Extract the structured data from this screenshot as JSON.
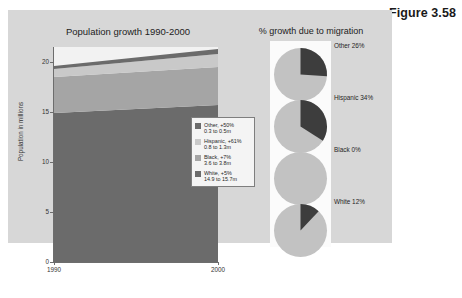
{
  "figure": {
    "caption": "Figure 3.58"
  },
  "area_chart": {
    "title": "Population growth 1990-2000",
    "ylabel": "Population in millions",
    "yticks": [
      "20",
      "15",
      "10",
      "5",
      "0"
    ],
    "xticks": [
      "1990",
      "2000"
    ]
  },
  "legend": {
    "items": [
      {
        "name": "other",
        "label": "Other, +50%",
        "detail": "0.3 to 0.5m",
        "color": "#6b6b6b"
      },
      {
        "name": "hispanic",
        "label": "Hispanic, +61%",
        "detail": "0.8 to 1.3m",
        "color": "#c9c9c9"
      },
      {
        "name": "black",
        "label": "Black, +7%",
        "detail": "3.6 to 3.8m",
        "color": "#a5a5a5"
      },
      {
        "name": "white",
        "label": "White, +5%",
        "detail": "14.9 to 15.7m",
        "color": "#6b6b6b"
      }
    ]
  },
  "pie_section": {
    "title": "% growth due to migration",
    "pies": [
      {
        "name": "other",
        "label": "Other  26%",
        "percent": 26
      },
      {
        "name": "hispanic",
        "label": "Hispanic  34%",
        "percent": 34
      },
      {
        "name": "black",
        "label": "Black  0%",
        "percent": 0
      },
      {
        "name": "white",
        "label": "White  12%",
        "percent": 12
      }
    ]
  },
  "colors": {
    "panel_bg": "#d7d7d7",
    "plot_bg": "#f2f2f2",
    "pie_light": "#c2c2c2",
    "pie_dark": "#3d3d3d",
    "axis": "#6d6d6d"
  },
  "chart_data": {
    "type": "area",
    "title": "Population growth 1990-2000",
    "xlabel": "",
    "ylabel": "Population in millions",
    "x": [
      1990,
      2000
    ],
    "xlim": [
      1990,
      2000
    ],
    "ylim": [
      0,
      21.5
    ],
    "yticks": [
      0,
      5,
      10,
      15,
      20
    ],
    "stacked": true,
    "grid": false,
    "legend_position": "inside-right",
    "series": [
      {
        "name": "White",
        "values": [
          14.9,
          15.7
        ],
        "growth_pct": 5,
        "color": "#6b6b6b"
      },
      {
        "name": "Black",
        "values": [
          3.6,
          3.8
        ],
        "growth_pct": 7,
        "color": "#a5a5a5"
      },
      {
        "name": "Hispanic",
        "values": [
          0.8,
          1.3
        ],
        "growth_pct": 61,
        "color": "#c9c9c9"
      },
      {
        "name": "Other",
        "values": [
          0.3,
          0.5
        ],
        "growth_pct": 50,
        "color": "#6b6b6b"
      }
    ],
    "totals": [
      19.6,
      21.3
    ]
  },
  "chart_data_pies": {
    "type": "pie",
    "title": "% growth due to migration",
    "charts": [
      {
        "name": "Other",
        "values": [
          26,
          74
        ],
        "labels": [
          "migration",
          "other"
        ]
      },
      {
        "name": "Hispanic",
        "values": [
          34,
          66
        ],
        "labels": [
          "migration",
          "other"
        ]
      },
      {
        "name": "Black",
        "values": [
          0,
          100
        ],
        "labels": [
          "migration",
          "other"
        ]
      },
      {
        "name": "White",
        "values": [
          12,
          88
        ],
        "labels": [
          "migration",
          "other"
        ]
      }
    ]
  }
}
